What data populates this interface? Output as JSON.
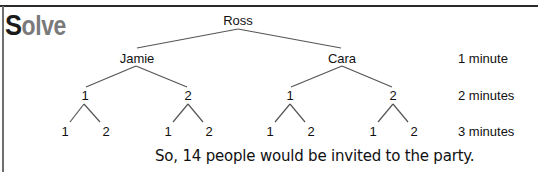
{
  "heading": {
    "first_letter": "S",
    "rest": "olve"
  },
  "tree": {
    "root": "Ross",
    "level1": [
      "Jamie",
      "Cara"
    ],
    "level2": [
      "1",
      "2",
      "1",
      "2"
    ],
    "level3": [
      "1",
      "2",
      "1",
      "2",
      "1",
      "2",
      "1",
      "2"
    ]
  },
  "time_labels": [
    "1 minute",
    "2 minutes",
    "3 minutes"
  ],
  "conclusion": "So, 14 people would be invited to the party.",
  "colors": {
    "rule": "#2a2a2a",
    "heading_first": "#1a1a1a",
    "heading_rest": "#7a7a7a",
    "lines": "#555555"
  }
}
